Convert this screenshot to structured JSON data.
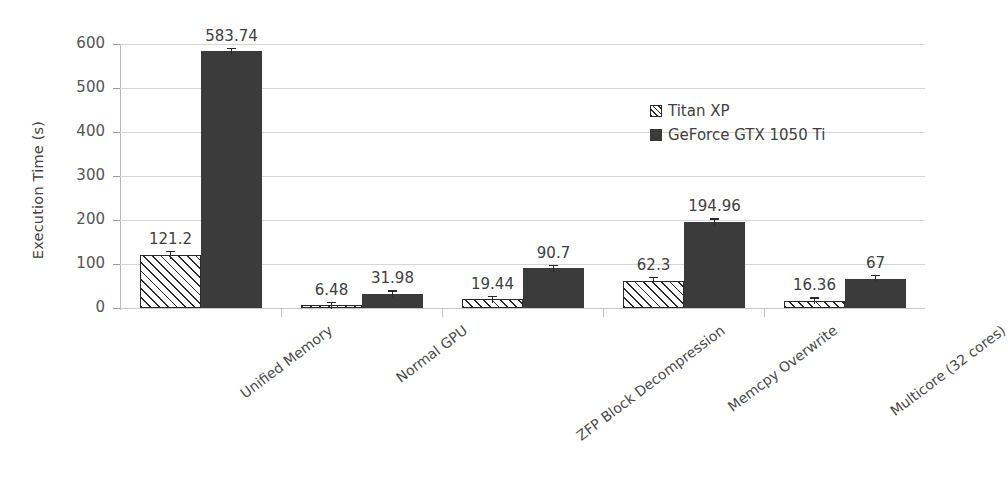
{
  "chart_data": {
    "type": "bar",
    "title": "",
    "xlabel": "",
    "ylabel": "Execution Time (s)",
    "ylim": [
      0,
      600
    ],
    "yticks": [
      0,
      100,
      200,
      300,
      400,
      500,
      600
    ],
    "ytick_labels": [
      "0",
      "100",
      "200",
      "300",
      "400",
      "500",
      "600"
    ],
    "grid": true,
    "legend_position": "upper right",
    "categories": [
      "Unified Memory",
      "Normal GPU",
      "ZFP Block Decompression",
      "Memcpy Overwrite",
      "Multicore (32 cores)"
    ],
    "series": [
      {
        "name": "Titan XP",
        "style": "hatched",
        "color": "#ffffff",
        "values": [
          121.2,
          6.48,
          19.44,
          62.3,
          16.36
        ],
        "value_labels": [
          "121.2",
          "6.48",
          "19.44",
          "62.3",
          "16.36"
        ],
        "errors": [
          9,
          1,
          2,
          4,
          2
        ]
      },
      {
        "name": "GeForce GTX 1050 Ti",
        "style": "solid",
        "color": "#3b3b3b",
        "values": [
          583.74,
          31.98,
          90.7,
          194.96,
          67
        ],
        "value_labels": [
          "583.74",
          "31.98",
          "90.7",
          "194.96",
          "67"
        ],
        "errors": [
          8,
          1,
          7,
          9,
          3
        ]
      }
    ]
  },
  "legend": {
    "items": [
      {
        "label": "Titan XP",
        "style": "hatched"
      },
      {
        "label": "GeForce GTX 1050 Ti",
        "style": "solid"
      }
    ]
  },
  "colors": {
    "series_1": "#ffffff",
    "series_2": "#3b3b3b",
    "grid": "#d7d7d7",
    "axis": "#b9b9b9",
    "text": "#444444",
    "background": "#ffffff"
  }
}
